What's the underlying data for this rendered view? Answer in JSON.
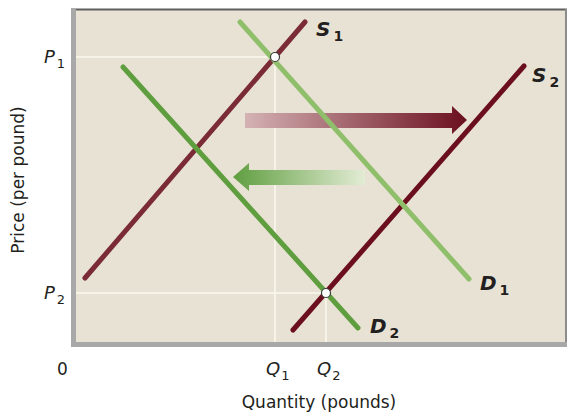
{
  "chart_data": {
    "type": "line",
    "title": "",
    "xlabel": "Quantity (pounds)",
    "ylabel": "Price (per pound)",
    "origin_label": "0",
    "x_ticks": [
      {
        "label": "Q",
        "sub": "1",
        "x": 275
      },
      {
        "label": "Q",
        "sub": "2",
        "x": 326
      }
    ],
    "y_ticks": [
      {
        "label": "P",
        "sub": "1",
        "y": 57
      },
      {
        "label": "P",
        "sub": "2",
        "y": 293
      }
    ],
    "series": [
      {
        "name": "S1",
        "label": "S",
        "sub": "1",
        "kind": "supply",
        "color": "#7a2b35",
        "from": [
          85,
          278
        ],
        "to": [
          305,
          22
        ],
        "label_pos": [
          316,
          36
        ]
      },
      {
        "name": "S2",
        "label": "S",
        "sub": "2",
        "kind": "supply",
        "color": "#6b0f1e",
        "from": [
          293,
          330
        ],
        "to": [
          524,
          66
        ],
        "label_pos": [
          532,
          82
        ]
      },
      {
        "name": "D1",
        "label": "D",
        "sub": "1",
        "kind": "demand",
        "color": "#8fbf6a",
        "from": [
          240,
          22
        ],
        "to": [
          469,
          279
        ],
        "label_pos": [
          480,
          290
        ]
      },
      {
        "name": "D2",
        "label": "D",
        "sub": "2",
        "kind": "demand",
        "color": "#5f9e3f",
        "from": [
          123,
          67
        ],
        "to": [
          358,
          328
        ],
        "label_pos": [
          370,
          333
        ]
      }
    ],
    "equilibria": [
      {
        "name": "E1",
        "x_label": "Q1",
        "y_label": "P1",
        "point": [
          275,
          57
        ]
      },
      {
        "name": "E2",
        "x_label": "Q2",
        "y_label": "P2",
        "point": [
          326,
          293
        ]
      }
    ],
    "annotations": [
      {
        "type": "arrow",
        "direction": "right",
        "meaning": "supply shift",
        "from": [
          245,
          120
        ],
        "to": [
          466,
          120
        ],
        "color_start": "#c9a3a6",
        "color_end": "#6b0f1e"
      },
      {
        "type": "arrow",
        "direction": "left",
        "meaning": "demand shift",
        "from": [
          365,
          177
        ],
        "to": [
          233,
          177
        ],
        "color_start": "#d9e8c4",
        "color_end": "#5f9e3f"
      }
    ],
    "plot_area": {
      "x": 71,
      "y": 9,
      "width": 496,
      "height": 338,
      "background": "#e8e2d4"
    },
    "grid": false,
    "legend": null
  }
}
